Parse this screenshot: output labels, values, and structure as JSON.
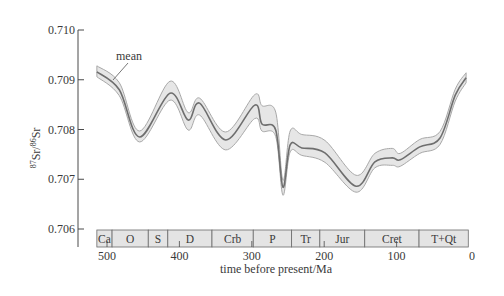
{
  "chart_data": {
    "type": "area",
    "title": "",
    "xlabel": "time before present/Ma",
    "ylabel": "87Sr/86Sr",
    "ylabel_parts": {
      "sup1": "87",
      "base1": "Sr",
      "slash": "/",
      "sup2": "86",
      "base2": "Sr"
    },
    "xlim": [
      514,
      0
    ],
    "ylim": [
      0.706,
      0.71
    ],
    "x_ticks": [
      500,
      400,
      300,
      200,
      100,
      0
    ],
    "x_tick_labels": [
      "500",
      "400",
      "300",
      "200",
      "100",
      "0"
    ],
    "y_ticks": [
      0.706,
      0.707,
      0.708,
      0.709,
      0.71
    ],
    "y_tick_labels": [
      "0.706",
      "0.707",
      "0.708",
      "0.709",
      "0.710"
    ],
    "grid": false,
    "annotation": {
      "text": "mean",
      "points_to": [
        495,
        0.7089
      ]
    },
    "series": [
      {
        "name": "mean",
        "x": [
          514,
          483,
          455,
          413,
          388,
          372,
          336,
          296,
          286,
          267,
          257,
          247,
          231,
          199,
          156,
          130,
          106,
          95,
          68,
          40,
          19,
          4
        ],
        "values": [
          0.70916,
          0.7088,
          0.70785,
          0.70873,
          0.70819,
          0.70853,
          0.70779,
          0.70849,
          0.70811,
          0.70799,
          0.70684,
          0.70769,
          0.70763,
          0.70753,
          0.70686,
          0.70735,
          0.70743,
          0.70739,
          0.70765,
          0.70783,
          0.70869,
          0.70904
        ]
      },
      {
        "name": "upper envelope",
        "x": [
          514,
          483,
          455,
          413,
          388,
          372,
          336,
          296,
          286,
          267,
          257,
          247,
          231,
          199,
          156,
          130,
          106,
          95,
          68,
          40,
          19,
          4
        ],
        "values": [
          0.70928,
          0.70894,
          0.70797,
          0.70897,
          0.70834,
          0.70863,
          0.70795,
          0.7087,
          0.70848,
          0.70835,
          0.70698,
          0.70797,
          0.7079,
          0.70778,
          0.70708,
          0.70752,
          0.70762,
          0.70752,
          0.7078,
          0.70796,
          0.70881,
          0.70914
        ]
      },
      {
        "name": "lower envelope",
        "x": [
          514,
          483,
          455,
          413,
          388,
          372,
          336,
          296,
          286,
          267,
          257,
          247,
          231,
          199,
          156,
          130,
          106,
          95,
          68,
          40,
          19,
          4
        ],
        "values": [
          0.70906,
          0.70868,
          0.70775,
          0.70859,
          0.70799,
          0.70829,
          0.70759,
          0.70822,
          0.70797,
          0.70786,
          0.70668,
          0.70755,
          0.70748,
          0.70734,
          0.70674,
          0.70723,
          0.70728,
          0.70726,
          0.70752,
          0.7077,
          0.70857,
          0.70894
        ]
      }
    ],
    "periods": [
      {
        "label": "Ca",
        "start": 514,
        "end": 493
      },
      {
        "label": "O",
        "start": 493,
        "end": 443
      },
      {
        "label": "S",
        "start": 443,
        "end": 416
      },
      {
        "label": "D",
        "start": 416,
        "end": 355
      },
      {
        "label": "Crb",
        "start": 355,
        "end": 298
      },
      {
        "label": "P",
        "start": 298,
        "end": 245
      },
      {
        "label": "Tr",
        "start": 245,
        "end": 206
      },
      {
        "label": "Jur",
        "start": 206,
        "end": 144
      },
      {
        "label": "Cret",
        "start": 144,
        "end": 69
      },
      {
        "label": "T+Qt",
        "start": 69,
        "end": 1
      }
    ],
    "colors": {
      "band_fill": "#e6e6e6",
      "band_edge": "#a8a8a8",
      "mean_line": "#6e6e6e",
      "axis": "#4a4a4a",
      "period_fill": "#e4e4e4",
      "period_edge": "#6a6a6a"
    }
  }
}
